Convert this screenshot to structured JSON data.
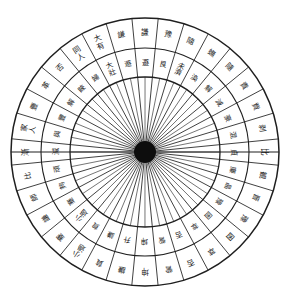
{
  "diagram": {
    "type": "circular-hexagram-wheel",
    "rings": 2,
    "sectors_per_ring": 32,
    "geometry": {
      "center_x": 145,
      "center_y": 152,
      "radius_outer": 134,
      "radius_mid": 104,
      "radius_inner": 75,
      "hub_radius": 11,
      "spokes": 32,
      "start_angle_deg": -95.6
    },
    "colors": {
      "background": "#ffffff",
      "stroke": "#3a3a3a",
      "stroke_heavy": "#1f1f1f",
      "hub": "#0d0d0d",
      "text": "#1a1a1a"
    },
    "outer_ring": [
      "謙",
      "豫",
      "隨",
      "蟱",
      "隨",
      "責",
      "貲",
      "剥",
      "比",
      "観",
      "晋",
      "豫",
      "囦",
      "萃",
      "否",
      "訾",
      "坤",
      "謙",
      "貟",
      "小過",
      "蹇",
      "謙",
      "師",
      "比",
      "漸",
      "家人",
      "豐",
      "革",
      "否",
      "同人",
      "大有",
      "謙"
    ],
    "inner_ring": [
      "遯",
      "艮",
      "未濟",
      "渙",
      "解",
      "減",
      "豪",
      "混",
      "貞",
      "廉",
      "晶",
      "豫",
      "囦",
      "萃",
      "否",
      "訾",
      "坤",
      "升",
      "謙",
      "貟",
      "小過",
      "蹇",
      "夠",
      "頑",
      "減",
      "與",
      "豐",
      "解",
      "睞",
      "婦",
      "大壯",
      "遯"
    ],
    "outer_ring_labels": [
      {
        "index": 1,
        "text": "謙",
        "note": "top"
      },
      {
        "index": 2,
        "text": "豫"
      },
      {
        "index": 3,
        "text": "隨"
      },
      {
        "index": 4,
        "text": "蟱"
      },
      {
        "index": 5,
        "text": "隨"
      },
      {
        "index": 6,
        "text": "責"
      },
      {
        "index": 7,
        "text": "貲"
      },
      {
        "index": 8,
        "text": "剥"
      },
      {
        "index": 9,
        "text": "比"
      },
      {
        "index": 10,
        "text": "観"
      },
      {
        "index": 11,
        "text": "晋"
      },
      {
        "index": 12,
        "text": "豫"
      },
      {
        "index": 13,
        "text": "囦"
      },
      {
        "index": 14,
        "text": "萃"
      },
      {
        "index": 15,
        "text": "否"
      },
      {
        "index": 16,
        "text": "訾"
      },
      {
        "index": 17,
        "text": "坤",
        "note": "bottom"
      },
      {
        "index": 18,
        "text": "謙"
      },
      {
        "index": 19,
        "text": "貟"
      },
      {
        "index": 20,
        "text": "小過"
      },
      {
        "index": 21,
        "text": "蹇"
      },
      {
        "index": 22,
        "text": "謙"
      },
      {
        "index": 23,
        "text": "師"
      },
      {
        "index": 24,
        "text": "比"
      },
      {
        "index": 25,
        "text": "漸"
      },
      {
        "index": 26,
        "text": "家人"
      },
      {
        "index": 27,
        "text": "豐"
      },
      {
        "index": 28,
        "text": "革"
      },
      {
        "index": 29,
        "text": "否"
      },
      {
        "index": 30,
        "text": "同人"
      },
      {
        "index": 31,
        "text": "大有"
      },
      {
        "index": 32,
        "text": "謙"
      }
    ]
  }
}
